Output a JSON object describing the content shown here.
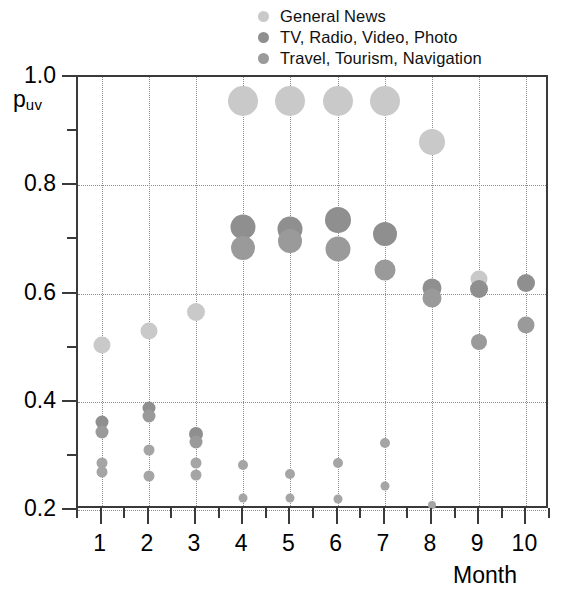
{
  "chart_data": {
    "type": "scatter",
    "title": "",
    "xlabel": "Month",
    "ylabel": "p_uv",
    "ylabel_main": "p",
    "ylabel_sub": "uv",
    "xlim": [
      0.5,
      10.5
    ],
    "ylim": [
      0.2,
      1.0
    ],
    "grid": true,
    "legend_position": "top",
    "y_ticks": [
      "1.0",
      "0.8",
      "0.6",
      "0.4",
      "0.2"
    ],
    "y_tick_values": [
      1.0,
      0.8,
      0.6,
      0.4,
      0.2
    ],
    "y_minor_tick_values": [
      0.9,
      0.7,
      0.5,
      0.3
    ],
    "x_ticks": [
      "1",
      "2",
      "3",
      "4",
      "5",
      "6",
      "7",
      "8",
      "9",
      "10"
    ],
    "x_tick_values": [
      1,
      2,
      3,
      4,
      5,
      6,
      7,
      8,
      9,
      10
    ],
    "series": [
      {
        "name": "General News",
        "color": "#c9c9c9",
        "points": [
          {
            "x": 1,
            "y": 0.505,
            "size": 17
          },
          {
            "x": 2,
            "y": 0.531,
            "size": 17
          },
          {
            "x": 3,
            "y": 0.565,
            "size": 18
          },
          {
            "x": 4,
            "y": 0.955,
            "size": 30
          },
          {
            "x": 5,
            "y": 0.955,
            "size": 30
          },
          {
            "x": 6,
            "y": 0.955,
            "size": 30
          },
          {
            "x": 7,
            "y": 0.955,
            "size": 30
          },
          {
            "x": 8,
            "y": 0.88,
            "size": 26
          },
          {
            "x": 9,
            "y": 0.626,
            "size": 17
          },
          {
            "x": 10,
            "y": 0.62,
            "size": 17
          }
        ]
      },
      {
        "name": "TV, Radio, Video, Photo",
        "color": "#8f8f8f",
        "points": [
          {
            "x": 1,
            "y": 0.362,
            "size": 13
          },
          {
            "x": 2,
            "y": 0.389,
            "size": 13
          },
          {
            "x": 3,
            "y": 0.341,
            "size": 14
          },
          {
            "x": 4,
            "y": 0.723,
            "size": 25
          },
          {
            "x": 5,
            "y": 0.719,
            "size": 25
          },
          {
            "x": 6,
            "y": 0.735,
            "size": 26
          },
          {
            "x": 7,
            "y": 0.71,
            "size": 24
          },
          {
            "x": 8,
            "y": 0.611,
            "size": 19
          },
          {
            "x": 9,
            "y": 0.609,
            "size": 18
          },
          {
            "x": 10,
            "y": 0.619,
            "size": 18
          }
        ]
      },
      {
        "name": "Travel, Tourism, Navigation",
        "color": "#9a9a9a",
        "points": [
          {
            "x": 1,
            "y": 0.345,
            "size": 13
          },
          {
            "x": 2,
            "y": 0.374,
            "size": 13
          },
          {
            "x": 3,
            "y": 0.325,
            "size": 13
          },
          {
            "x": 4,
            "y": 0.684,
            "size": 24
          },
          {
            "x": 5,
            "y": 0.697,
            "size": 24
          },
          {
            "x": 6,
            "y": 0.682,
            "size": 25
          },
          {
            "x": 7,
            "y": 0.644,
            "size": 21
          },
          {
            "x": 8,
            "y": 0.592,
            "size": 19
          },
          {
            "x": 9,
            "y": 0.511,
            "size": 16
          },
          {
            "x": 10,
            "y": 0.541,
            "size": 17
          }
        ]
      },
      {
        "name": "unlabeled-small-a",
        "color": "#a5a5a5",
        "points": [
          {
            "x": 1,
            "y": 0.287,
            "size": 11
          },
          {
            "x": 2,
            "y": 0.311,
            "size": 11
          },
          {
            "x": 3,
            "y": 0.287,
            "size": 11
          },
          {
            "x": 4,
            "y": 0.283,
            "size": 10
          },
          {
            "x": 5,
            "y": 0.266,
            "size": 10
          },
          {
            "x": 6,
            "y": 0.287,
            "size": 10
          },
          {
            "x": 7,
            "y": 0.324,
            "size": 10
          },
          {
            "x": 8,
            "y": 0.209,
            "size": 8
          }
        ]
      },
      {
        "name": "unlabeled-small-b",
        "color": "#a5a5a5",
        "points": [
          {
            "x": 1,
            "y": 0.271,
            "size": 11
          },
          {
            "x": 2,
            "y": 0.262,
            "size": 11
          },
          {
            "x": 3,
            "y": 0.264,
            "size": 11
          },
          {
            "x": 4,
            "y": 0.223,
            "size": 9
          },
          {
            "x": 5,
            "y": 0.222,
            "size": 9
          },
          {
            "x": 6,
            "y": 0.22,
            "size": 9
          },
          {
            "x": 7,
            "y": 0.245,
            "size": 9
          }
        ]
      }
    ]
  },
  "legend": {
    "items": [
      {
        "label": "General News",
        "color": "#c9c9c9"
      },
      {
        "label": "TV, Radio, Video, Photo",
        "color": "#8f8f8f"
      },
      {
        "label": "Travel, Tourism, Navigation",
        "color": "#9a9a9a"
      }
    ]
  },
  "axes": {
    "y_title_main": "p",
    "y_title_sub": "uv",
    "x_title": "Month"
  }
}
